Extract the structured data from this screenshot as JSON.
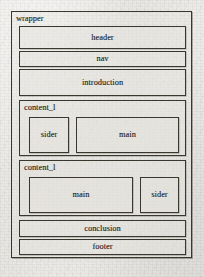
{
  "diagram": {
    "type": "page-layout-wireframe",
    "title": "wrapper",
    "colors": {
      "page_background": "#e9e7e3",
      "box_border": "#3a372f",
      "box_fill": "#e4e2dd",
      "label_text": "#23211c"
    },
    "wrapper": {
      "label": "wrapper",
      "children": [
        {
          "name": "header",
          "label": "header"
        },
        {
          "name": "nav",
          "label": "nav"
        },
        {
          "name": "introduction",
          "label": "introduction"
        },
        {
          "name": "content_1",
          "label": "content_l",
          "children": [
            {
              "name": "sider",
              "label": "sider"
            },
            {
              "name": "main",
              "label": "main"
            }
          ]
        },
        {
          "name": "content_2",
          "label": "content_l",
          "children": [
            {
              "name": "main",
              "label": "main"
            },
            {
              "name": "sider",
              "label": "sider"
            }
          ]
        },
        {
          "name": "conclusion",
          "label": "conclusion"
        },
        {
          "name": "footer",
          "label": "footer"
        }
      ]
    }
  }
}
